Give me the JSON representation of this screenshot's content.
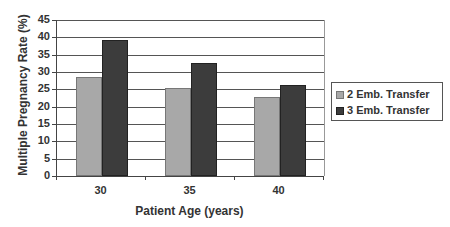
{
  "chart_data": {
    "type": "bar",
    "title": "",
    "xlabel": "Patient Age (years)",
    "ylabel": "Multiple Pregnancy Rate (%)",
    "categories": [
      "30",
      "35",
      "40"
    ],
    "series": [
      {
        "name": "2 Emb. Transfer",
        "color": "#a8a8a8",
        "values": [
          28.5,
          25.5,
          22.8
        ]
      },
      {
        "name": "3 Emb. Transfer",
        "color": "#3c3c3c",
        "values": [
          39.3,
          32.5,
          26.3
        ]
      }
    ],
    "ylim": [
      0,
      45
    ],
    "yticks": [
      "0",
      "5",
      "10",
      "15",
      "20",
      "25",
      "30",
      "35",
      "40",
      "45"
    ],
    "grid": true,
    "legend_position": "right"
  }
}
